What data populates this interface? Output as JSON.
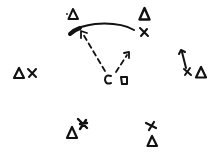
{
  "diagram": {
    "type": "hand-drawn play diagram",
    "background": "#ffffff",
    "ink_color": "#111111",
    "symbols": {
      "triangle": "defender",
      "x": "offensive player",
      "c": "C marker",
      "square": "square marker"
    },
    "triangles": [
      {
        "id": "t-top-left",
        "x": 73,
        "y": 15
      },
      {
        "id": "t-top-right",
        "x": 144,
        "y": 15
      },
      {
        "id": "t-left",
        "x": 19,
        "y": 73
      },
      {
        "id": "t-right",
        "x": 200,
        "y": 73
      },
      {
        "id": "t-bottom-left",
        "x": 72,
        "y": 133
      },
      {
        "id": "t-bottom-right",
        "x": 152,
        "y": 142
      }
    ],
    "xs": [
      {
        "id": "x-top-right",
        "x": 144,
        "y": 32
      },
      {
        "id": "x-left",
        "x": 32,
        "y": 73
      },
      {
        "id": "x-right",
        "x": 188,
        "y": 72
      },
      {
        "id": "x-bottom-left",
        "x": 83,
        "y": 124
      },
      {
        "id": "x-bottom-right",
        "x": 151,
        "y": 126
      }
    ],
    "c_marker": {
      "label": "C",
      "x": 108,
      "y": 80
    },
    "square_marker": {
      "x": 124,
      "y": 81
    },
    "arrows": [
      {
        "id": "dashed-arrow-left",
        "style": "dashed",
        "from": [
          105,
          71
        ],
        "to": [
          81,
          31
        ]
      },
      {
        "id": "dashed-arrow-right",
        "style": "dashed",
        "from": [
          116,
          72
        ],
        "to": [
          129,
          52
        ]
      },
      {
        "id": "solid-arrow-right",
        "style": "solid",
        "from": [
          186,
          69
        ],
        "to": [
          181,
          50
        ]
      }
    ],
    "curves": [
      {
        "id": "curved-path-top",
        "style": "solid",
        "from": [
          134,
          30
        ],
        "to": [
          72,
          33
        ]
      }
    ]
  }
}
